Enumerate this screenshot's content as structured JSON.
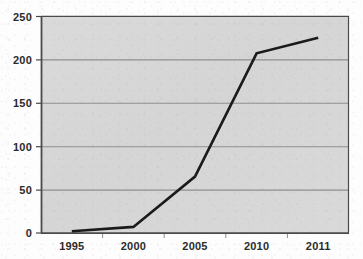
{
  "chart_data": {
    "type": "line",
    "title": "",
    "subtitle": "",
    "xlabel": "",
    "ylabel": "",
    "categories": [
      "1995",
      "2000",
      "2005",
      "2010",
      "2011"
    ],
    "values": [
      2,
      7,
      65,
      207,
      225
    ],
    "series": [
      {
        "name": "",
        "values": [
          2,
          7,
          65,
          207,
          225
        ]
      }
    ],
    "ylim": [
      0,
      250
    ],
    "yticks": [
      0,
      50,
      100,
      150,
      200,
      250
    ],
    "ytick_labels": [
      "0",
      "50",
      "100",
      "150",
      "200",
      "250"
    ],
    "xtick_labels": [
      "1995",
      "2000",
      "2005",
      "2010",
      "2011"
    ],
    "grid": true,
    "grid_axis": "y",
    "legend": false,
    "legend_position": "none",
    "annotations": []
  },
  "style": {
    "plot_background": "#d7d7d7",
    "line_color": "#1a1a1a",
    "grid_color": "#8f8f8f",
    "axis_color": "#4a4a4a",
    "label_color": "#2b2b2b",
    "page_background": "#fdfdfd"
  },
  "geometry": {
    "plot_left": 41,
    "plot_top": 16,
    "plot_right": 349,
    "plot_bottom": 233
  }
}
